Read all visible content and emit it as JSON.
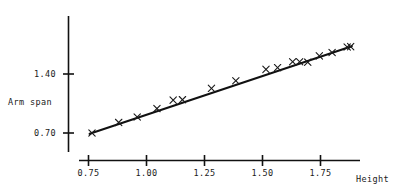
{
  "chart_data": {
    "type": "scatter",
    "title": "",
    "subtitle": "",
    "xlabel": "Height",
    "ylabel": "Arm span",
    "grid": false,
    "legend": null,
    "xlim": [
      0.7,
      1.91
    ],
    "ylim": [
      0.62,
      1.85
    ],
    "xticks": [
      0.75,
      1.0,
      1.25,
      1.5,
      1.75
    ],
    "xtick_labels": [
      "0.75",
      "1.00",
      "1.25",
      "1.50",
      "1.75"
    ],
    "yticks": [
      0.7,
      1.4
    ],
    "ytick_labels": [
      "0.70",
      "1.40"
    ],
    "marker": "x",
    "marker_color": "#1a1a1a",
    "line_color": "#111111",
    "points": [
      {
        "x": 0.765,
        "y": 0.7
      },
      {
        "x": 0.88,
        "y": 0.825
      },
      {
        "x": 0.96,
        "y": 0.89
      },
      {
        "x": 1.045,
        "y": 0.99
      },
      {
        "x": 1.115,
        "y": 1.09
      },
      {
        "x": 1.155,
        "y": 1.095
      },
      {
        "x": 1.28,
        "y": 1.23
      },
      {
        "x": 1.385,
        "y": 1.32
      },
      {
        "x": 1.515,
        "y": 1.455
      },
      {
        "x": 1.565,
        "y": 1.475
      },
      {
        "x": 1.63,
        "y": 1.545
      },
      {
        "x": 1.66,
        "y": 1.545
      },
      {
        "x": 1.695,
        "y": 1.54
      },
      {
        "x": 1.745,
        "y": 1.615
      },
      {
        "x": 1.8,
        "y": 1.655
      },
      {
        "x": 1.865,
        "y": 1.72
      },
      {
        "x": 1.88,
        "y": 1.725
      }
    ],
    "fit_line": {
      "type": "linear",
      "x_start": 0.755,
      "y_start": 0.69,
      "x_end": 1.885,
      "y_end": 1.73
    }
  },
  "axes": {
    "y_title": "Arm span",
    "x_title": "Height",
    "y_tick_labels": [
      "1.40",
      "0.70"
    ],
    "x_tick_labels": [
      "0.75",
      "1.00",
      "1.25",
      "1.50",
      "1.75"
    ]
  }
}
